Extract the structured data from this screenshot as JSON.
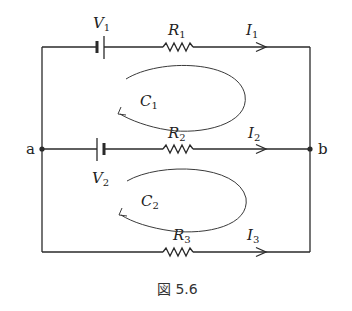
{
  "figure": {
    "caption": "図 5.6",
    "type": "circuit-diagram",
    "nodes": [
      {
        "id": "a",
        "label": "a"
      },
      {
        "id": "b",
        "label": "b"
      }
    ],
    "branches": [
      {
        "id": "top",
        "source": {
          "name": "V",
          "sub": "1"
        },
        "resistor": {
          "name": "R",
          "sub": "1"
        },
        "current": {
          "name": "I",
          "sub": "1"
        }
      },
      {
        "id": "middle",
        "source": {
          "name": "V",
          "sub": "2"
        },
        "resistor": {
          "name": "R",
          "sub": "2"
        },
        "current": {
          "name": "I",
          "sub": "2"
        }
      },
      {
        "id": "bottom",
        "resistor": {
          "name": "R",
          "sub": "3"
        },
        "current": {
          "name": "I",
          "sub": "3"
        }
      }
    ],
    "loops": [
      {
        "name": "C",
        "sub": "1",
        "direction": "counterclockwise"
      },
      {
        "name": "C",
        "sub": "2",
        "direction": "counterclockwise"
      }
    ]
  }
}
